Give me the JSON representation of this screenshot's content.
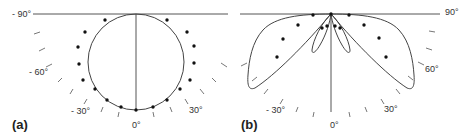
{
  "panels": [
    {
      "id": "a",
      "label": "(a)",
      "angle_labels": {
        "m90": "- 90°",
        "m60": "- 60°",
        "m30": "- 30°",
        "zero": "0°",
        "p30": "30°"
      },
      "description": "Polar radiation pattern: circular (Lambertian-like) curve with measured data points"
    },
    {
      "id": "b",
      "label": "(b)",
      "angle_labels": {
        "p90": "90°",
        "p60": "60°",
        "p30": "30°",
        "m30": "- 30°",
        "zero": "0°"
      },
      "description": "Polar radiation pattern: two side lobes with small inner lobes and measured data points"
    }
  ],
  "colors": {
    "line": "#444444",
    "dot": "#111111",
    "tick": "#777777",
    "text": "#333333"
  }
}
